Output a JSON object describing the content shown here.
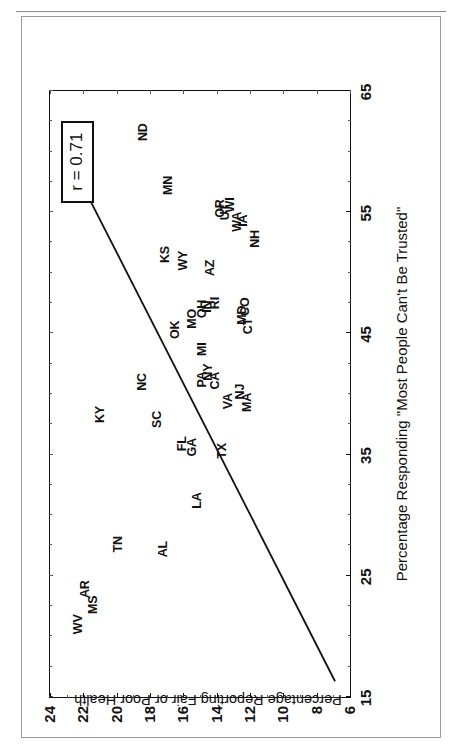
{
  "page_header": {
    "left_text": "",
    "right_text": ""
  },
  "chart_data": {
    "type": "scatter",
    "title": "",
    "xlabel": "Percentage Responding \"Most People Can't Be Trusted\"",
    "ylabel": "Percentage Reporting Fair or Poor Health",
    "xlim": [
      15,
      65
    ],
    "ylim": [
      6,
      24
    ],
    "xticks": [
      15,
      25,
      35,
      45,
      55,
      65
    ],
    "yticks": [
      6,
      8,
      10,
      12,
      14,
      16,
      18,
      20,
      22,
      24
    ],
    "xtick_labels": [
      "15",
      "25",
      "35",
      "45",
      "55",
      "65"
    ],
    "ytick_labels": [
      "6",
      "8",
      "10",
      "12",
      "14",
      "16",
      "18",
      "20",
      "22",
      "24"
    ],
    "grid": false,
    "legend": null,
    "annotations": [
      {
        "name": "correlation-box",
        "text": "r = 0.71",
        "x": 59.5,
        "y": 22.3
      }
    ],
    "trendline": {
      "type": "linear",
      "x": [
        16.3,
        56.0
      ],
      "y": [
        6.9,
        21.6
      ]
    },
    "point_label_style": "state-abbreviation",
    "labels": [
      "WV",
      "MS",
      "AR",
      "TN",
      "AL",
      "LA",
      "KY",
      "SC",
      "NC",
      "GA",
      "FL",
      "TX",
      "VA",
      "OK",
      "MO",
      "IN",
      "RI",
      "OH",
      "AZ",
      "MI",
      "NY",
      "PA",
      "CA",
      "NJ",
      "MA",
      "CO",
      "MD",
      "CT",
      "OR",
      "WI",
      "UT",
      "WA",
      "IA",
      "NH",
      "KS",
      "WY",
      "MN",
      "ND"
    ],
    "points": [
      {
        "label": "WV",
        "x": 21.0,
        "y": 22.3
      },
      {
        "label": "MS",
        "x": 22.6,
        "y": 21.4
      },
      {
        "label": "AR",
        "x": 23.9,
        "y": 21.9
      },
      {
        "label": "TN",
        "x": 27.6,
        "y": 19.9
      },
      {
        "label": "AL",
        "x": 27.2,
        "y": 17.2
      },
      {
        "label": "LA",
        "x": 31.2,
        "y": 15.2
      },
      {
        "label": "KY",
        "x": 38.3,
        "y": 21.0
      },
      {
        "label": "SC",
        "x": 37.9,
        "y": 17.6
      },
      {
        "label": "NC",
        "x": 41.0,
        "y": 18.5
      },
      {
        "label": "GA",
        "x": 35.6,
        "y": 15.5
      },
      {
        "label": "FL",
        "x": 35.9,
        "y": 16.1
      },
      {
        "label": "TX",
        "x": 35.3,
        "y": 13.7
      },
      {
        "label": "VA",
        "x": 39.4,
        "y": 13.3
      },
      {
        "label": "OK",
        "x": 45.3,
        "y": 16.5
      },
      {
        "label": "MO",
        "x": 46.2,
        "y": 15.5
      },
      {
        "label": "IN",
        "x": 47.2,
        "y": 14.6
      },
      {
        "label": "RI",
        "x": 47.5,
        "y": 14.1
      },
      {
        "label": "OH",
        "x": 47.0,
        "y": 14.9
      },
      {
        "label": "AZ",
        "x": 50.4,
        "y": 14.4
      },
      {
        "label": "MI",
        "x": 43.7,
        "y": 14.9
      },
      {
        "label": "NY",
        "x": 41.8,
        "y": 14.5
      },
      {
        "label": "PA",
        "x": 41.2,
        "y": 14.9
      },
      {
        "label": "CA",
        "x": 41.1,
        "y": 14.1
      },
      {
        "label": "NJ",
        "x": 40.2,
        "y": 12.6
      },
      {
        "label": "MA",
        "x": 39.3,
        "y": 12.2
      },
      {
        "label": "CO",
        "x": 47.2,
        "y": 12.3
      },
      {
        "label": "MD",
        "x": 46.5,
        "y": 12.5
      },
      {
        "label": "CT",
        "x": 45.6,
        "y": 12.1
      },
      {
        "label": "OR",
        "x": 55.3,
        "y": 13.8
      },
      {
        "label": "WI",
        "x": 55.6,
        "y": 13.2
      },
      {
        "label": "UT",
        "x": 55.0,
        "y": 13.5
      },
      {
        "label": "WA",
        "x": 54.2,
        "y": 12.8
      },
      {
        "label": "IA",
        "x": 54.3,
        "y": 12.4
      },
      {
        "label": "NH",
        "x": 52.8,
        "y": 11.7
      },
      {
        "label": "KS",
        "x": 51.5,
        "y": 17.1
      },
      {
        "label": "WY",
        "x": 51.0,
        "y": 16.0
      },
      {
        "label": "MN",
        "x": 57.2,
        "y": 16.9
      },
      {
        "label": "ND",
        "x": 61.6,
        "y": 18.4
      }
    ]
  }
}
